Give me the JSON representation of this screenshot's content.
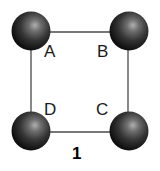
{
  "diagram": {
    "caption": "1",
    "vertices": [
      {
        "id": "A",
        "label": "A",
        "cx": 31,
        "cy": 31,
        "r": 19.5,
        "label_x": 45,
        "label_y": 57
      },
      {
        "id": "B",
        "label": "B",
        "cx": 129,
        "cy": 31,
        "r": 19.5,
        "label_x": 97,
        "label_y": 57
      },
      {
        "id": "C",
        "label": "C",
        "cx": 129,
        "cy": 131,
        "r": 19.5,
        "label_x": 96,
        "label_y": 115
      },
      {
        "id": "D",
        "label": "D",
        "cx": 31,
        "cy": 131,
        "r": 19.5,
        "label_x": 44,
        "label_y": 115
      }
    ],
    "edges": [
      {
        "from": "A",
        "to": "B"
      },
      {
        "from": "B",
        "to": "C"
      },
      {
        "from": "C",
        "to": "D"
      },
      {
        "from": "D",
        "to": "A"
      }
    ],
    "colors": {
      "sphere_highlight": "#a8a8a8",
      "sphere_mid": "#3a3a3a",
      "sphere_edge": "#0e0e0e",
      "edge": "#4a4a4a",
      "label": "#1a1a1a"
    }
  }
}
